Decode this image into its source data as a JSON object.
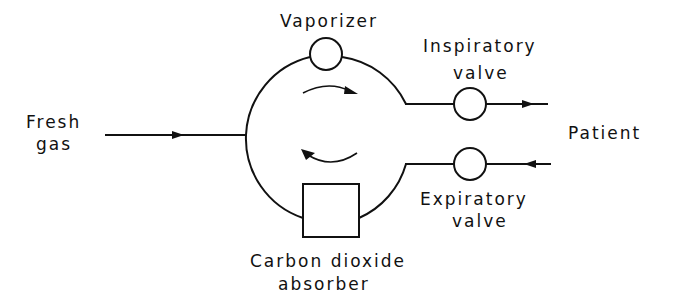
{
  "diagram": {
    "type": "anesthesia circle breathing system",
    "labels": {
      "fresh_gas_line1": "Fresh",
      "fresh_gas_line2": "gas",
      "vaporizer": "Vaporizer",
      "inspiratory_line1": "Inspiratory",
      "inspiratory_line2": "valve",
      "patient": "Patient",
      "expiratory_line1": "Expiratory",
      "expiratory_line2": "valve",
      "absorber_line1": "Carbon dioxide",
      "absorber_line2": "absorber"
    },
    "components": [
      {
        "id": "vaporizer",
        "shape": "circle"
      },
      {
        "id": "inspiratory-valve",
        "shape": "circle"
      },
      {
        "id": "expiratory-valve",
        "shape": "circle"
      },
      {
        "id": "co2-absorber",
        "shape": "rectangle"
      }
    ],
    "flows": [
      {
        "from": "fresh-gas",
        "to": "circle-loop",
        "direction": "right"
      },
      {
        "from": "circle-loop",
        "to": "patient",
        "via": "inspiratory-valve",
        "direction": "right"
      },
      {
        "from": "patient",
        "to": "circle-loop",
        "via": "expiratory-valve",
        "direction": "left"
      },
      {
        "loop": "clockwise"
      }
    ],
    "colors": {
      "line": "#111111",
      "background": "#ffffff"
    }
  }
}
